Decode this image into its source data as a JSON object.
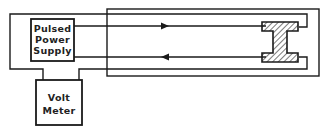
{
  "diagram": {
    "power_supply": {
      "label_lines": [
        "Pulsed",
        "Power",
        "Supply"
      ]
    },
    "volt_meter": {
      "label_lines": [
        "Volt",
        "Meter"
      ]
    },
    "specimen": {
      "shape": "I-beam cross-section",
      "fill": "hatched"
    },
    "arrows": [
      {
        "direction": "right",
        "line": "upper"
      },
      {
        "direction": "left",
        "line": "lower"
      }
    ],
    "colors": {
      "stroke": "#1a1a1a",
      "background": "#ffffff"
    }
  }
}
